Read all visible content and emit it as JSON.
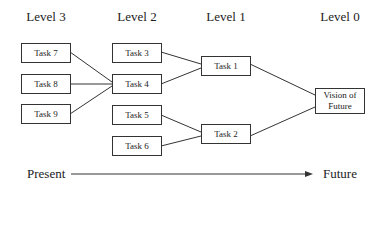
{
  "levels": [
    {
      "label": "Level 3"
    },
    {
      "label": "Level 2"
    },
    {
      "label": "Level 1"
    },
    {
      "label": "Level 0"
    }
  ],
  "tasks": {
    "task7": "Task 7",
    "task8": "Task 8",
    "task9": "Task 9",
    "task3": "Task 3",
    "task4": "Task 4",
    "task5": "Task 5",
    "task6": "Task 6",
    "task1": "Task 1",
    "task2": "Task 2",
    "vision": "Vision of Future"
  },
  "edges": [
    [
      "Task 7",
      "Task 4"
    ],
    [
      "Task 8",
      "Task 4"
    ],
    [
      "Task 9",
      "Task 4"
    ],
    [
      "Task 3",
      "Task 1"
    ],
    [
      "Task 4",
      "Task 1"
    ],
    [
      "Task 5",
      "Task 2"
    ],
    [
      "Task 6",
      "Task 2"
    ],
    [
      "Task 1",
      "Vision of Future"
    ],
    [
      "Task 2",
      "Vision of Future"
    ]
  ],
  "timeline": {
    "start": "Present",
    "end": "Future"
  }
}
